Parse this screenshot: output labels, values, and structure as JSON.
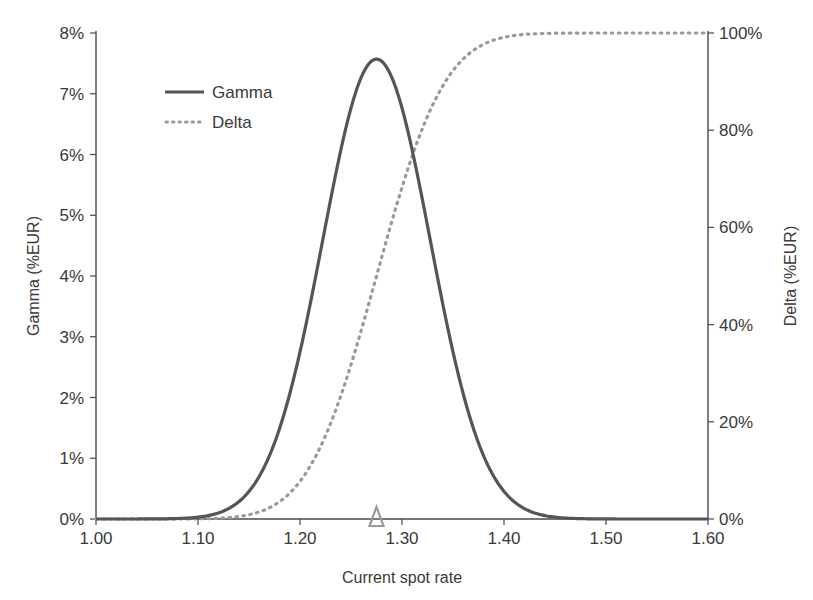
{
  "chart_data": {
    "type": "line",
    "title": "",
    "xlabel": "Current spot rate",
    "ylabel": "Gamma (%EUR)",
    "y2label": "Delta (%EUR)",
    "xlim": [
      1.0,
      1.6
    ],
    "ylim": [
      0,
      8
    ],
    "y2lim": [
      0,
      100
    ],
    "x_ticks": [
      "1.00",
      "1.10",
      "1.20",
      "1.30",
      "1.40",
      "1.50",
      "1.60"
    ],
    "y_ticks": [
      "0%",
      "1%",
      "2%",
      "3%",
      "4%",
      "5%",
      "6%",
      "7%",
      "8%"
    ],
    "y2_ticks": [
      "0%",
      "20%",
      "40%",
      "60%",
      "80%",
      "100%"
    ],
    "grid": false,
    "legend_position": "upper-left",
    "marker": {
      "label": "current spot",
      "x": 1.275,
      "shape": "triangle",
      "color": "#9a9a9a"
    },
    "x": [
      1.0,
      1.05,
      1.08,
      1.1,
      1.12,
      1.15,
      1.18,
      1.2,
      1.22,
      1.25,
      1.275,
      1.3,
      1.32,
      1.35,
      1.38,
      1.4,
      1.43,
      1.45,
      1.48,
      1.5,
      1.55,
      1.6
    ],
    "series": [
      {
        "name": "Gamma",
        "axis": "left",
        "style": "solid",
        "color": "#555555",
        "values": [
          0.0,
          0.02,
          0.08,
          0.2,
          0.5,
          1.4,
          3.0,
          4.3,
          5.6,
          7.0,
          7.57,
          7.1,
          6.2,
          4.6,
          2.9,
          2.0,
          0.95,
          0.55,
          0.2,
          0.08,
          0.01,
          0.0
        ]
      },
      {
        "name": "Delta",
        "axis": "right",
        "style": "dotted",
        "color": "#9a9a9a",
        "values": [
          0.0,
          0.0,
          0.3,
          0.8,
          2.0,
          6.0,
          15.0,
          23.0,
          32.0,
          43.0,
          53.0,
          65.0,
          73.0,
          84.0,
          92.0,
          95.5,
          98.5,
          99.3,
          99.8,
          100.0,
          100.0,
          100.0
        ]
      }
    ]
  },
  "legend": {
    "gamma_label": "Gamma",
    "delta_label": "Delta"
  },
  "axes": {
    "x_title": "Current spot rate",
    "y_left_title": "Gamma (%EUR)",
    "y_right_title": "Delta (%EUR)"
  },
  "colors": {
    "gamma": "#555555",
    "delta": "#9a9a9a",
    "axis": "#4a4a4a",
    "marker": "#9a9a9a"
  }
}
